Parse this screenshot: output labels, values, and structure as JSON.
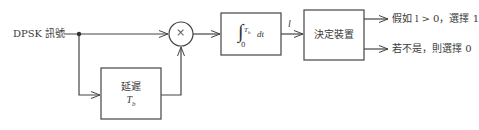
{
  "diagram": {
    "input_label": "DPSK 訊號",
    "multiplier_symbol": "×",
    "delay_block": {
      "title": "延遲",
      "param": "T",
      "param_sub": "b"
    },
    "integrator_block": {
      "integral_sign": "∫",
      "lower": "0",
      "upper": "T",
      "upper_sub": "b",
      "differential": "dt"
    },
    "integrator_output_label": "l",
    "decision_block": {
      "title": "決定裝置"
    },
    "outputs": [
      {
        "label": "假如 l > 0，選擇 1"
      },
      {
        "label": "若不是，則選擇 0"
      }
    ],
    "colors": {
      "line": "#444444",
      "text": "#3a3a3a"
    }
  }
}
